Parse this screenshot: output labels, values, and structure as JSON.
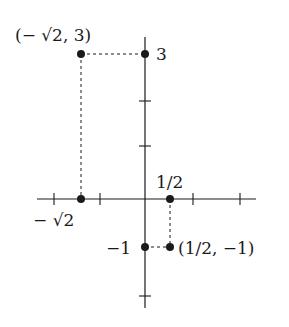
{
  "diagram": {
    "type": "coordinate-plane-plotted-points",
    "axes": {
      "origin_px": [
        145,
        199
      ],
      "x_axis_px": [
        37,
        256
      ],
      "y_axis_px": [
        37,
        308
      ],
      "x_ticks_px": [
        54,
        100,
        193,
        240
      ],
      "y_ticks_px": [
        101,
        146,
        296
      ]
    },
    "points": [
      {
        "id": "p-neg-sqrt2-3",
        "label": "(− √2,  3)",
        "px": [
          81,
          54
        ]
      },
      {
        "id": "p-y3",
        "label": "3",
        "px": [
          145,
          54
        ]
      },
      {
        "id": "p-x-neg-sqrt2",
        "label": "− √2",
        "px": [
          81,
          199
        ]
      },
      {
        "id": "p-x-half",
        "label": "1/2",
        "px": [
          170,
          199
        ]
      },
      {
        "id": "p-y-neg1",
        "label": "−1",
        "px": [
          145,
          247
        ]
      },
      {
        "id": "p-half-neg1",
        "label": "(1/2,  −1)",
        "px": [
          170,
          247
        ]
      }
    ],
    "labels": {
      "top_left_point": "(− √2,  3)",
      "y_three": "3",
      "x_neg_sqrt2": "− √2",
      "x_half": "1/2",
      "y_neg_one": "−1",
      "bottom_right_point": "(1/2,  −1)"
    },
    "colors": {
      "ink": "#1a1a1a",
      "background": "#ffffff"
    }
  }
}
